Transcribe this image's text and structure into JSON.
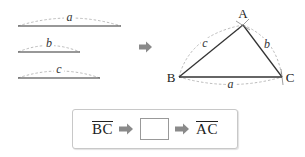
{
  "diagram": {
    "segments": [
      {
        "label": "a",
        "x1": 18,
        "x2": 121,
        "y": 26
      },
      {
        "label": "b",
        "x1": 18,
        "x2": 80,
        "y": 52
      },
      {
        "label": "c",
        "x1": 18,
        "x2": 100,
        "y": 78
      }
    ],
    "flow_arrow": {
      "icon": "right-arrow-icon",
      "color": "#8a8a8a"
    },
    "triangle": {
      "vertices": {
        "A": "A",
        "B": "B",
        "C": "C"
      },
      "sides": {
        "AB": "c",
        "AC": "b",
        "BC": "a"
      }
    },
    "sequence_box": {
      "start": "BC",
      "blank": "",
      "end": "AC"
    },
    "colors": {
      "line": "#333333",
      "dashed_arc": "#aaaaaa",
      "arrow": "#8a8a8a",
      "box_border": "#c8c8c8"
    }
  }
}
